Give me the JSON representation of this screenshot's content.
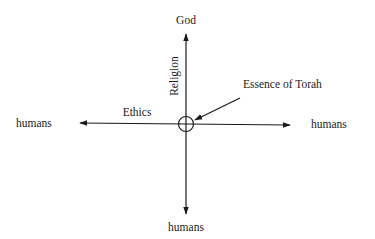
{
  "diagram": {
    "type": "cross-axes",
    "labels": {
      "top": "God",
      "left": "humans",
      "right": "humans",
      "bottom": "humans",
      "vertical_axis": "Religion",
      "horizontal_axis": "Ethics",
      "center_callout": "Essence of Torah"
    },
    "center_marker": "circle-with-crosshair"
  }
}
